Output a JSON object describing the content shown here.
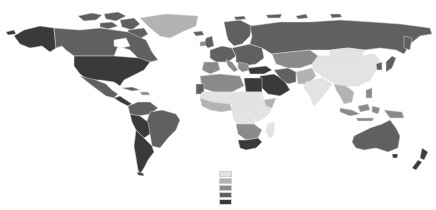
{
  "map": {
    "type": "choropleth",
    "projection": "equirectangular-like world map",
    "title": "",
    "palette": {
      "c1": "#e3e3e3",
      "c2": "#b3b3b3",
      "c3": "#8a8a8a",
      "c4": "#606060",
      "c5": "#3a3a3a"
    },
    "legend": {
      "labels": [],
      "classes": [
        "c1",
        "c2",
        "c3",
        "c4",
        "c5"
      ],
      "position": "bottom-center"
    },
    "regions": [
      {
        "name": "Alaska",
        "class": "c5"
      },
      {
        "name": "Canada",
        "class": "c4"
      },
      {
        "name": "Greenland",
        "class": "c2"
      },
      {
        "name": "United States",
        "class": "c5"
      },
      {
        "name": "Mexico",
        "class": "c4"
      },
      {
        "name": "Central America",
        "class": "c5"
      },
      {
        "name": "Caribbean",
        "class": "c4"
      },
      {
        "name": "Colombia/Venezuela",
        "class": "c4"
      },
      {
        "name": "Brazil",
        "class": "c4"
      },
      {
        "name": "Peru/Bolivia",
        "class": "c5"
      },
      {
        "name": "Argentina/Chile",
        "class": "c5"
      },
      {
        "name": "Western Europe",
        "class": "c4"
      },
      {
        "name": "Iberia",
        "class": "c3"
      },
      {
        "name": "Scandinavia",
        "class": "c4"
      },
      {
        "name": "Eastern Europe",
        "class": "c4"
      },
      {
        "name": "Russia",
        "class": "c4"
      },
      {
        "name": "Kazakhstan/Central Asia",
        "class": "c3"
      },
      {
        "name": "Turkey",
        "class": "c5"
      },
      {
        "name": "Middle East",
        "class": "c5"
      },
      {
        "name": "Iran",
        "class": "c4"
      },
      {
        "name": "North Africa",
        "class": "c3"
      },
      {
        "name": "Egypt/Libya",
        "class": "c5"
      },
      {
        "name": "Sahel",
        "class": "c1"
      },
      {
        "name": "West Africa",
        "class": "c2"
      },
      {
        "name": "Central Africa",
        "class": "c1"
      },
      {
        "name": "East Africa",
        "class": "c1"
      },
      {
        "name": "Southern Africa",
        "class": "c3"
      },
      {
        "name": "South Africa",
        "class": "c5"
      },
      {
        "name": "Madagascar",
        "class": "c1"
      },
      {
        "name": "Pakistan/Afghanistan",
        "class": "c2"
      },
      {
        "name": "India",
        "class": "c1"
      },
      {
        "name": "China",
        "class": "c1"
      },
      {
        "name": "Mongolia",
        "class": "c1"
      },
      {
        "name": "Southeast Asia",
        "class": "c2"
      },
      {
        "name": "Japan/Korea",
        "class": "c4"
      },
      {
        "name": "Indonesia",
        "class": "c3"
      },
      {
        "name": "Philippines",
        "class": "c3"
      },
      {
        "name": "Australia",
        "class": "c4"
      },
      {
        "name": "New Zealand",
        "class": "c5"
      },
      {
        "name": "Arctic islands",
        "class": "c4"
      }
    ]
  }
}
